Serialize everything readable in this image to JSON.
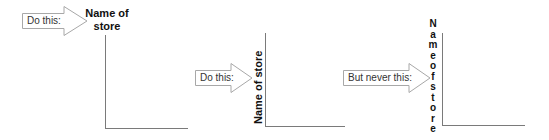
{
  "panels": [
    {
      "arrow_label": "Do this:",
      "axis_title": "Name of store",
      "axis_title_lines": [
        "Name of",
        "store"
      ],
      "style": "horizontal-above-axis"
    },
    {
      "arrow_label": "Do this:",
      "axis_title": "Name of store",
      "style": "rotated-vertical"
    },
    {
      "arrow_label": "But never this:",
      "axis_title": "Name of store",
      "axis_title_letters": [
        "N",
        "a",
        "m",
        "e",
        "o",
        "f",
        "s",
        "t",
        "o",
        "r",
        "e"
      ],
      "style": "stacked-letters"
    }
  ],
  "colors": {
    "arrow_stroke": "#a8a8a8",
    "axis": "#7a7a7a",
    "text": "#111111"
  }
}
